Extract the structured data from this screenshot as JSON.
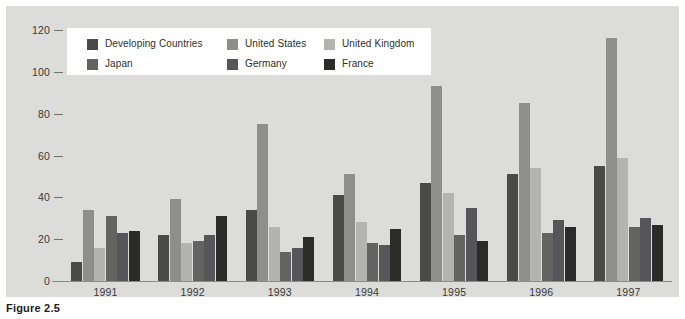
{
  "figure": {
    "caption": "Figure 2.5",
    "panel_color": "#dcdcda",
    "background_color": "#ffffff"
  },
  "legend": {
    "items": [
      {
        "label": "Developing Countries",
        "color": "#4a4a48"
      },
      {
        "label": "United States",
        "color": "#8e8e8c"
      },
      {
        "label": "United Kingdom",
        "color": "#b3b3b1"
      },
      {
        "label": "Japan",
        "color": "#636361"
      },
      {
        "label": "Germany",
        "color": "#56565a"
      },
      {
        "label": "France",
        "color": "#2b2b29"
      }
    ]
  },
  "chart_data": {
    "type": "bar",
    "title": "",
    "xlabel": "",
    "ylabel": "",
    "ylim": [
      0,
      120
    ],
    "yticks": [
      0,
      20,
      40,
      60,
      80,
      100,
      120
    ],
    "grid": false,
    "legend_position": "top-left-inside",
    "categories": [
      "1991",
      "1992",
      "1993",
      "1994",
      "1995",
      "1996",
      "1997"
    ],
    "series": [
      {
        "name": "Developing Countries",
        "color": "#4a4a48",
        "values": [
          9,
          22,
          34,
          41,
          47,
          51,
          55
        ]
      },
      {
        "name": "United States",
        "color": "#8e8e8c",
        "values": [
          34,
          39,
          75,
          51,
          93,
          85,
          116
        ]
      },
      {
        "name": "United Kingdom",
        "color": "#b3b3b1",
        "values": [
          16,
          18,
          26,
          28,
          42,
          54,
          59
        ]
      },
      {
        "name": "Japan",
        "color": "#636361",
        "values": [
          31,
          19,
          14,
          18,
          22,
          23,
          26
        ]
      },
      {
        "name": "Germany",
        "color": "#56565a",
        "values": [
          23,
          22,
          16,
          17,
          35,
          29,
          30
        ]
      },
      {
        "name": "France",
        "color": "#2b2b29",
        "values": [
          24,
          31,
          21,
          25,
          19,
          26,
          27
        ]
      }
    ]
  }
}
